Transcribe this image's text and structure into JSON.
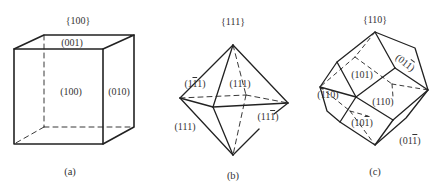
{
  "figure": {
    "panels": [
      {
        "id": "a",
        "family": "{100}",
        "caption": "(a)",
        "shape": "cube",
        "faces": [
          {
            "label": "(001)",
            "overline": [
              false,
              false,
              false
            ]
          },
          {
            "label": "(100)",
            "overline": [
              false,
              false,
              false
            ]
          },
          {
            "label": "(010)",
            "overline": [
              false,
              false,
              false
            ]
          }
        ]
      },
      {
        "id": "b",
        "family": "{111}",
        "caption": "(b)",
        "shape": "octahedron",
        "faces": [
          {
            "label": "(111)",
            "digits": [
              "1",
              "1",
              "1"
            ],
            "overline": [
              false,
              true,
              false
            ]
          },
          {
            "label": "(111)",
            "digits": [
              "1",
              "1",
              "1"
            ],
            "overline": [
              false,
              false,
              false
            ]
          },
          {
            "label": "(111)",
            "digits": [
              "1",
              "1",
              "1"
            ],
            "overline": [
              false,
              false,
              true
            ]
          },
          {
            "label": "(111)",
            "digits": [
              "1",
              "1",
              "1"
            ],
            "overline": [
              false,
              false,
              false
            ]
          }
        ]
      },
      {
        "id": "c",
        "family": "{110}",
        "caption": "(c)",
        "shape": "rhombic-dodecahedron",
        "faces": [
          {
            "label": "(011)",
            "digits": [
              "0",
              "1",
              "1"
            ],
            "overline": [
              false,
              false,
              true
            ]
          },
          {
            "label": "(101)",
            "digits": [
              "1",
              "0",
              "1"
            ],
            "overline": [
              false,
              false,
              false
            ]
          },
          {
            "label": "(110)",
            "digits": [
              "1",
              "1",
              "0"
            ],
            "overline": [
              true,
              false,
              false
            ]
          },
          {
            "label": "(110)",
            "digits": [
              "1",
              "1",
              "0"
            ],
            "overline": [
              false,
              false,
              false
            ]
          },
          {
            "label": "(101)",
            "digits": [
              "1",
              "0",
              "1"
            ],
            "overline": [
              false,
              false,
              true
            ]
          },
          {
            "label": "(011)",
            "digits": [
              "0",
              "1",
              "1"
            ],
            "overline": [
              false,
              false,
              true
            ]
          }
        ]
      }
    ]
  }
}
